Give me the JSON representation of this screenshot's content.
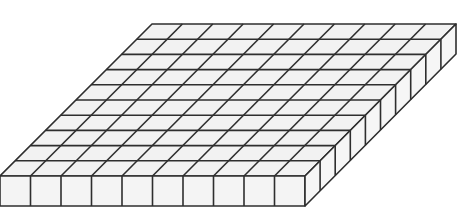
{
  "diagram": {
    "rows": 10,
    "cols": 10,
    "geometry": {
      "back_left": [
        152,
        24
      ],
      "back_right": [
        456,
        24
      ],
      "front_left": [
        0,
        176
      ],
      "front_right": [
        305,
        176
      ],
      "depth": 30
    },
    "colors": {
      "background": "#ffffff",
      "top_face": "#f2f2f2",
      "front_face": "#f4f4f4",
      "side_face": "#f6f6f6",
      "stroke": "#2e2e2e"
    },
    "stroke_width": 1.6
  }
}
